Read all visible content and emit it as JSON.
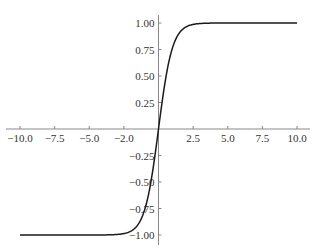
{
  "chart_data": {
    "type": "line",
    "title": "",
    "xlabel": "",
    "ylabel": "",
    "xlim": [
      -10,
      10
    ],
    "ylim": [
      -1,
      1
    ],
    "grid": false,
    "legend": null,
    "function": "tanh(x)",
    "x_ticks": [
      {
        "value": -10,
        "label": "-10.0"
      },
      {
        "value": -7.5,
        "label": "-7.5"
      },
      {
        "value": -5,
        "label": "-5.0"
      },
      {
        "value": -2.5,
        "label": "-2.0"
      },
      {
        "value": 2.5,
        "label": "2.5"
      },
      {
        "value": 5,
        "label": "5.0"
      },
      {
        "value": 7.5,
        "label": "7.5"
      },
      {
        "value": 10,
        "label": "10.0"
      }
    ],
    "y_ticks": [
      {
        "value": 1,
        "label": "1.00"
      },
      {
        "value": 0.75,
        "label": "0.75"
      },
      {
        "value": 0.5,
        "label": "0.50"
      },
      {
        "value": 0.25,
        "label": "0.25"
      },
      {
        "value": -0.25,
        "label": "-0.25"
      },
      {
        "value": -0.5,
        "label": "-0.50"
      },
      {
        "value": -0.75,
        "label": "-0.75"
      },
      {
        "value": -1,
        "label": "-1.00"
      }
    ],
    "series": [
      {
        "name": "tanh",
        "color": "#1a1a1a",
        "x": [
          -10,
          -7.5,
          -5,
          -3,
          -2.5,
          -2,
          -1.5,
          -1,
          -0.5,
          0,
          0.5,
          1,
          1.5,
          2,
          2.5,
          3,
          5,
          7.5,
          10
        ],
        "y": [
          -1.0,
          -1.0,
          -0.9999,
          -0.995,
          -0.987,
          -0.964,
          -0.905,
          -0.762,
          -0.462,
          0.0,
          0.462,
          0.762,
          0.905,
          0.964,
          0.987,
          0.995,
          0.9999,
          1.0,
          1.0
        ]
      }
    ]
  },
  "layout": {
    "origin_px": [
      158.5,
      129
    ],
    "x_scale_px_per_unit": 13.85,
    "y_scale_px_per_unit": 106,
    "axis_color": "#888888",
    "line_color": "#1a1a1a"
  }
}
